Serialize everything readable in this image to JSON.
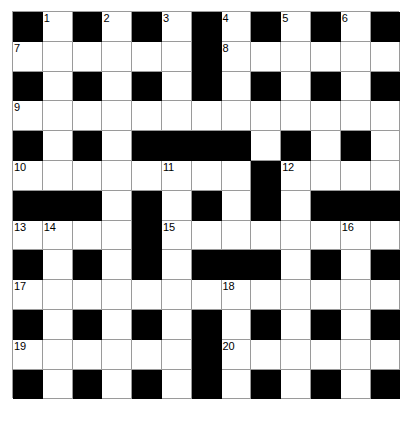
{
  "puzzle": {
    "title": "Crossword Grid",
    "rows": 13,
    "cols": 13,
    "cell_size": 29.8,
    "colors": {
      "block": "#000000",
      "cell": "#ffffff",
      "grid_line": "#9a9a9a",
      "number": "#000000",
      "page_background": "#ffffff"
    },
    "grid": [
      [
        "#",
        ".",
        "#",
        ".",
        "#",
        ".",
        "#",
        ".",
        "#",
        ".",
        "#",
        ".",
        "#"
      ],
      [
        ".",
        ".",
        ".",
        ".",
        ".",
        ".",
        "#",
        ".",
        ".",
        ".",
        ".",
        ".",
        "."
      ],
      [
        "#",
        ".",
        "#",
        ".",
        "#",
        ".",
        "#",
        ".",
        "#",
        ".",
        "#",
        ".",
        "#"
      ],
      [
        ".",
        ".",
        ".",
        ".",
        ".",
        ".",
        ".",
        ".",
        ".",
        ".",
        ".",
        ".",
        "."
      ],
      [
        "#",
        ".",
        "#",
        ".",
        "#",
        "#",
        "#",
        "#",
        ".",
        "#",
        ".",
        "#",
        "."
      ],
      [
        ".",
        ".",
        ".",
        ".",
        ".",
        ".",
        ".",
        ".",
        "#",
        ".",
        ".",
        ".",
        "."
      ],
      [
        "#",
        "#",
        "#",
        ".",
        "#",
        ".",
        "#",
        ".",
        "#",
        ".",
        "#",
        "#",
        "#"
      ],
      [
        ".",
        ".",
        ".",
        ".",
        "#",
        ".",
        ".",
        ".",
        ".",
        ".",
        ".",
        ".",
        "."
      ],
      [
        "#",
        ".",
        "#",
        ".",
        "#",
        ".",
        "#",
        "#",
        "#",
        ".",
        "#",
        ".",
        "#"
      ],
      [
        ".",
        ".",
        ".",
        ".",
        ".",
        ".",
        ".",
        ".",
        ".",
        ".",
        ".",
        ".",
        "."
      ],
      [
        "#",
        ".",
        "#",
        ".",
        "#",
        ".",
        "#",
        ".",
        "#",
        ".",
        "#",
        ".",
        "#"
      ],
      [
        ".",
        ".",
        ".",
        ".",
        ".",
        ".",
        "#",
        ".",
        ".",
        ".",
        ".",
        ".",
        "."
      ],
      [
        "#",
        ".",
        "#",
        ".",
        "#",
        ".",
        "#",
        ".",
        "#",
        ".",
        "#",
        ".",
        "#"
      ]
    ],
    "numbers": [
      {
        "row": 0,
        "col": 1,
        "label": "1"
      },
      {
        "row": 0,
        "col": 3,
        "label": "2"
      },
      {
        "row": 0,
        "col": 5,
        "label": "3"
      },
      {
        "row": 0,
        "col": 7,
        "label": "4"
      },
      {
        "row": 0,
        "col": 9,
        "label": "5"
      },
      {
        "row": 0,
        "col": 11,
        "label": "6"
      },
      {
        "row": 1,
        "col": 0,
        "label": "7"
      },
      {
        "row": 1,
        "col": 7,
        "label": "8"
      },
      {
        "row": 3,
        "col": 0,
        "label": "9"
      },
      {
        "row": 5,
        "col": 0,
        "label": "10"
      },
      {
        "row": 5,
        "col": 5,
        "label": "11"
      },
      {
        "row": 5,
        "col": 9,
        "label": "12"
      },
      {
        "row": 7,
        "col": 0,
        "label": "13"
      },
      {
        "row": 7,
        "col": 1,
        "label": "14"
      },
      {
        "row": 7,
        "col": 5,
        "label": "15"
      },
      {
        "row": 7,
        "col": 11,
        "label": "16"
      },
      {
        "row": 9,
        "col": 0,
        "label": "17"
      },
      {
        "row": 9,
        "col": 7,
        "label": "18"
      },
      {
        "row": 11,
        "col": 0,
        "label": "19"
      },
      {
        "row": 11,
        "col": 7,
        "label": "20"
      }
    ],
    "entries": []
  }
}
